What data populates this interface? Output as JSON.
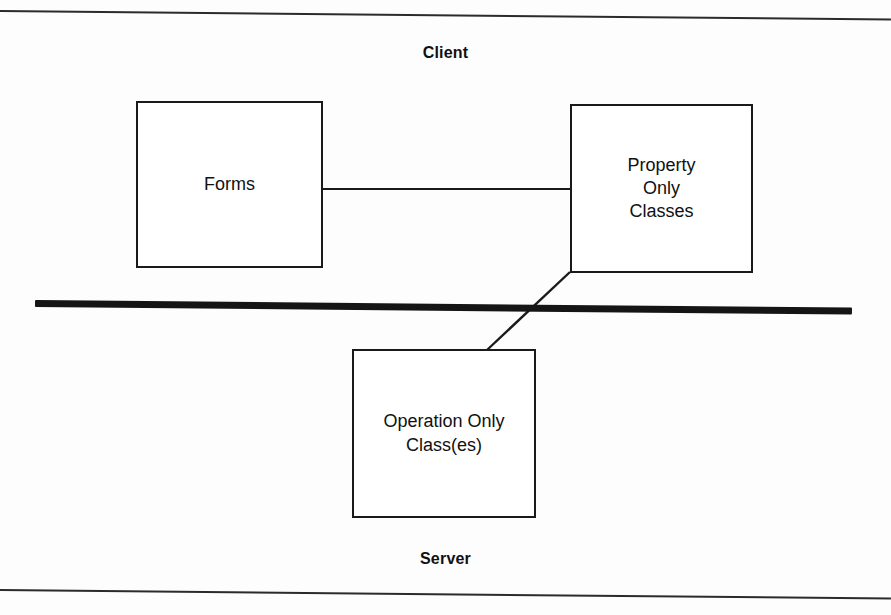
{
  "page": {
    "width": 891,
    "height": 615,
    "background_color": "#fdfdfd",
    "rule_color": "#2b2b2b"
  },
  "diagram": {
    "type": "deployment-partition-diagram",
    "title_top": "Client",
    "title_bottom": "Server",
    "divider": {
      "name": "client-server-boundary",
      "style": "thick-horizontal-bar",
      "color": "#151515"
    },
    "tiers": [
      {
        "id": "client",
        "label": "Client"
      },
      {
        "id": "server",
        "label": "Server"
      }
    ],
    "nodes": [
      {
        "id": "forms",
        "label": "Forms",
        "tier": "client",
        "x": 136,
        "y": 101,
        "width": 187,
        "height": 167
      },
      {
        "id": "property-only-classes",
        "label": "Property\nOnly\nClasses",
        "tier": "client",
        "x": 570,
        "y": 104,
        "width": 183,
        "height": 169
      },
      {
        "id": "operation-only-classes",
        "label": "Operation Only\nClass(es)",
        "tier": "server",
        "x": 352,
        "y": 349,
        "width": 184,
        "height": 169
      }
    ],
    "connections": [
      {
        "id": "forms-to-property",
        "from": "forms",
        "to": "property-only-classes",
        "style": "straight-horizontal"
      },
      {
        "id": "property-to-operation",
        "from": "property-only-classes",
        "to": "operation-only-classes",
        "style": "diagonal-crossing-boundary"
      }
    ]
  }
}
